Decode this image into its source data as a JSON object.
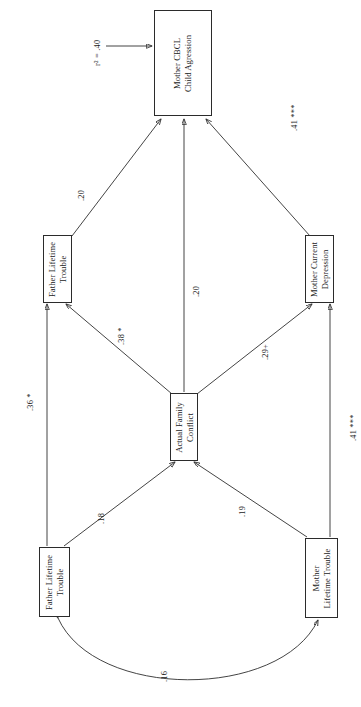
{
  "figure": {
    "type": "path-diagram",
    "orientation": "rotated-90-ccw",
    "variance_label": "r² = .40"
  },
  "nodes": [
    {
      "id": "mother_cbcl",
      "line1": "Mother CBCL",
      "line2": "Child Agression"
    },
    {
      "id": "father_trouble_top",
      "line1": "Father Lifetime",
      "line2": "Trouble"
    },
    {
      "id": "mother_depression",
      "line1": "Mother Current",
      "line2": "Depression"
    },
    {
      "id": "family_conflict",
      "line1": "Actual Family",
      "line2": "Conflict"
    },
    {
      "id": "father_trouble_bottom",
      "line1": "Father Lifetime",
      "line2": "Trouble"
    },
    {
      "id": "mother_trouble",
      "line1": "Mother",
      "line2": "Lifetime Trouble"
    }
  ],
  "paths": [
    {
      "id": "p_father_top_to_cbcl",
      "from": "father_trouble_top",
      "to": "mother_cbcl",
      "label": ".20"
    },
    {
      "id": "p_conflict_to_cbcl",
      "from": "family_conflict",
      "to": "mother_cbcl",
      "label": ".20"
    },
    {
      "id": "p_depression_to_cbcl",
      "from": "mother_depression",
      "to": "mother_cbcl",
      "label": ".41 ***"
    },
    {
      "id": "p_conflict_to_father_top",
      "from": "family_conflict",
      "to": "father_trouble_top",
      "label": ".38 *"
    },
    {
      "id": "p_conflict_to_depression",
      "from": "family_conflict",
      "to": "mother_depression",
      "label": ".29+"
    },
    {
      "id": "p_father_bottom_to_conflict",
      "from": "father_trouble_bottom",
      "to": "family_conflict",
      "label": ".18"
    },
    {
      "id": "p_mother_trouble_to_conflict",
      "from": "mother_trouble",
      "to": "family_conflict",
      "label": ".19"
    },
    {
      "id": "p_father_bottom_to_father_top",
      "from": "father_trouble_bottom",
      "to": "father_trouble_top",
      "label": ".36 *"
    },
    {
      "id": "p_mother_trouble_to_depression",
      "from": "mother_trouble",
      "to": "mother_depression",
      "label": ".41 ***"
    },
    {
      "id": "p_covariance",
      "from": "father_trouble_bottom",
      "to": "mother_trouble",
      "label": ".16"
    }
  ]
}
